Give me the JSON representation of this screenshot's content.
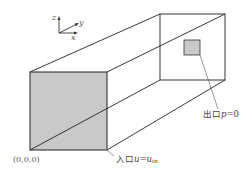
{
  "diagram": {
    "axes": {
      "x_label": "x",
      "y_label": "y",
      "z_label": "z"
    },
    "origin_label": "(0,0,0)",
    "inlet": {
      "label_cn": "入口",
      "var": "u",
      "eq": "=",
      "rhs": "u",
      "rhs_sub": "in",
      "fill": "#c9c9c9"
    },
    "outlet": {
      "label_cn": "出口",
      "var": "p",
      "eq": "=",
      "value": "0",
      "fill": "#c9c9c9"
    },
    "colors": {
      "line": "#222222",
      "face_fill": "#c9c9c9",
      "leader": "#555555"
    }
  }
}
